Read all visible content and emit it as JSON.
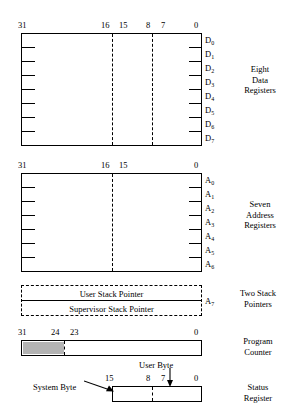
{
  "figure": {
    "colors": {
      "outline": "#000000",
      "background": "#ffffff",
      "shaded_field": "#b3b3b3"
    }
  },
  "data_registers": {
    "bit_labels": [
      "31",
      "16",
      "15",
      "8",
      "7",
      "0"
    ],
    "registers": [
      {
        "base": "D",
        "index": "0"
      },
      {
        "base": "D",
        "index": "1"
      },
      {
        "base": "D",
        "index": "2"
      },
      {
        "base": "D",
        "index": "3"
      },
      {
        "base": "D",
        "index": "4"
      },
      {
        "base": "D",
        "index": "5"
      },
      {
        "base": "D",
        "index": "6"
      },
      {
        "base": "D",
        "index": "7"
      }
    ],
    "side_caption": "Eight\nData\nRegisters",
    "side_caption_lines": [
      "Eight",
      "Data",
      "Registers"
    ]
  },
  "address_registers": {
    "bit_labels": [
      "31",
      "16",
      "15",
      "0"
    ],
    "registers": [
      {
        "base": "A",
        "index": "0"
      },
      {
        "base": "A",
        "index": "1"
      },
      {
        "base": "A",
        "index": "2"
      },
      {
        "base": "A",
        "index": "3"
      },
      {
        "base": "A",
        "index": "4"
      },
      {
        "base": "A",
        "index": "5"
      },
      {
        "base": "A",
        "index": "6"
      }
    ],
    "side_caption_lines": [
      "Seven",
      "Address",
      "Registers"
    ]
  },
  "stack_pointers": {
    "user_label": "User Stack Pointer",
    "supervisor_label": "Supervisor Stack Pointer",
    "register": {
      "base": "A",
      "index": "7"
    },
    "side_caption_lines": [
      "Two Stack",
      "Pointers"
    ]
  },
  "program_counter": {
    "bit_labels": [
      "31",
      "24",
      "23",
      "0"
    ],
    "side_caption_lines": [
      "Program",
      "Counter"
    ],
    "shaded_field_bits": "31-24"
  },
  "status_register": {
    "bit_labels": [
      "15",
      "8",
      "7",
      "0"
    ],
    "system_byte_label": "System Byte",
    "user_byte_label": "User Byte",
    "side_caption_lines": [
      "Status",
      "Register"
    ]
  }
}
